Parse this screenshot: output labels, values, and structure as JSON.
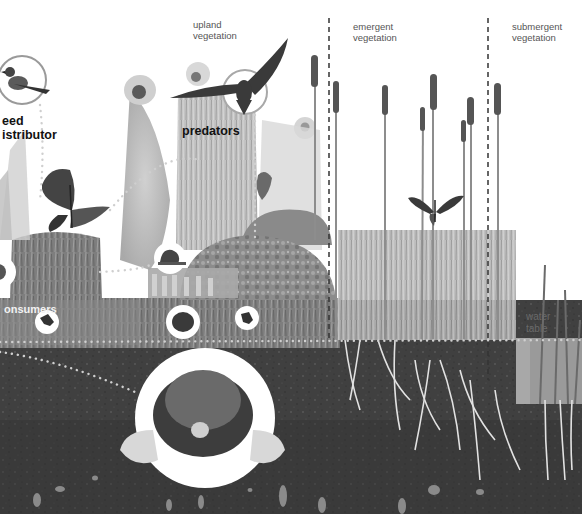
{
  "diagram": {
    "style": "grayscale photo collage",
    "zones": [
      {
        "id": "upland",
        "line1": "upland",
        "line2": "vegetation"
      },
      {
        "id": "emergent",
        "line1": "emergent",
        "line2": "vegetation"
      },
      {
        "id": "submergent",
        "line1": "submergent",
        "line2": "vegetation"
      }
    ],
    "roles": {
      "seed_distributor": {
        "line1": "eed",
        "line2": "istributor",
        "animal": "blue jay"
      },
      "predators": {
        "label": "predators",
        "animal": "hawk"
      },
      "consumers": {
        "label": "onsumers",
        "animals": [
          "snail",
          "frog",
          "toad",
          "frog"
        ]
      }
    },
    "water_table": {
      "line1": "water",
      "line2": "table"
    },
    "featured_animals": [
      "blue jay",
      "hawk",
      "monarch butterfly",
      "tiger swallowtail butterfly",
      "snail",
      "frog",
      "toad",
      "mole"
    ],
    "colors": {
      "sky": "#ffffff",
      "soil_dark": "#3a3a3a",
      "soil_mid": "#4d4d4d",
      "grass": "#8a8a8a",
      "root": "#e8e8e8",
      "dotted_line": "#dddddd",
      "zone_divider": "#333333",
      "water": "#9a9a9a"
    }
  }
}
